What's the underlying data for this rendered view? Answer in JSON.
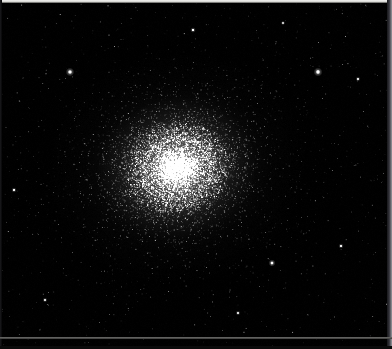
{
  "image": {
    "subject_name": "globular-star-cluster",
    "description": "Deep-sky astronomical photograph of a globular star cluster",
    "width": 392,
    "height": 349,
    "background_color": "#000000",
    "star_color": "#ffffff",
    "core_glow_color": "#ffffff"
  },
  "cluster": {
    "center_x": 177,
    "center_y": 168,
    "core_radius": 26,
    "halo_radius": 132,
    "ellipticity": 0.88,
    "rotation_deg": -12,
    "core_peak_brightness": 1.0,
    "resolved_star_count": 6400,
    "halo_star_count": 2600,
    "field_star_count": 900
  },
  "field_stars": [
    {
      "name": "bright-foreground-star-left",
      "x": 70,
      "y": 72,
      "radius": 2.3,
      "brightness": 1.0
    },
    {
      "name": "bright-foreground-star-right",
      "x": 318,
      "y": 72,
      "radius": 2.4,
      "brightness": 1.0
    },
    {
      "name": "bright-field-star-lower-right",
      "x": 272,
      "y": 263,
      "radius": 1.9,
      "brightness": 0.92
    },
    {
      "name": "field-star-upper-middle",
      "x": 193,
      "y": 30,
      "radius": 1.5,
      "brightness": 0.8
    },
    {
      "name": "field-star-left-mid",
      "x": 14,
      "y": 190,
      "radius": 1.4,
      "brightness": 0.75
    },
    {
      "name": "field-star-right-upper",
      "x": 358,
      "y": 79,
      "radius": 1.3,
      "brightness": 0.72
    },
    {
      "name": "field-star-lower-left",
      "x": 45,
      "y": 300,
      "radius": 1.3,
      "brightness": 0.7
    },
    {
      "name": "field-star-lower-middle",
      "x": 238,
      "y": 313,
      "radius": 1.3,
      "brightness": 0.7
    },
    {
      "name": "field-star-right-lower",
      "x": 341,
      "y": 246,
      "radius": 1.4,
      "brightness": 0.74
    },
    {
      "name": "field-star-top-right",
      "x": 283,
      "y": 23,
      "radius": 1.2,
      "brightness": 0.66
    }
  ],
  "borders": {
    "top_line_color": "#f2f2f0",
    "bottom_line_color": "#6e6e6c",
    "right_edge_color": "#9a9aa0",
    "left_edge_color": "#1b1b1e"
  },
  "render": {
    "seed": 20240617,
    "noise_amount": 0.12
  }
}
